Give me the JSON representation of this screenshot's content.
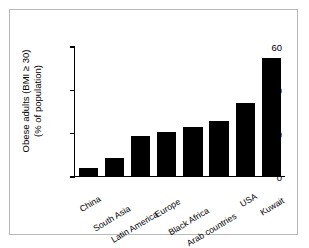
{
  "chart_data": {
    "type": "bar",
    "title": "",
    "xlabel": "",
    "ylabel_line1": "Obese adults (BMI ≥ 30)",
    "ylabel_line2": "(% of population)",
    "categories": [
      "China",
      "South Asia",
      "Latin America",
      "Europe",
      "Black Africa",
      "Arab countries",
      "USA",
      "Kuwait"
    ],
    "values": [
      4,
      9,
      19,
      21,
      23,
      26,
      34,
      55
    ],
    "ylim": [
      0,
      60
    ],
    "yticks": [
      0,
      20,
      40,
      60
    ],
    "ytick_labels": [
      "0",
      "20",
      "40",
      "60"
    ],
    "grid": false,
    "legend": false,
    "bar_color": "#000000",
    "axis_color": "#000000",
    "background_color": "#ffffff",
    "frame_color": "#b9b9b9"
  }
}
